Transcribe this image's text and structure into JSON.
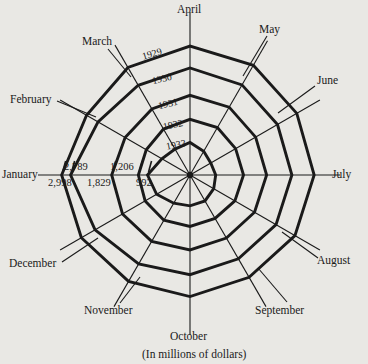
{
  "figure": {
    "caption": "(In millions of dollars)",
    "background_color": "#e9e8e4",
    "line_color": "#1a1a1a"
  },
  "chart_data": {
    "type": "line",
    "subtype": "polar-radar",
    "title": "",
    "subtitle": "",
    "xlabel": "",
    "ylabel": "",
    "caption": "(In millions of dollars)",
    "units": "millions of dollars",
    "grid": false,
    "legend_position": "inline-radial-labels",
    "angular_axis": {
      "label": "Month",
      "start_angle_deg": 90,
      "direction": "clockwise",
      "categories": [
        "January",
        "February",
        "March",
        "April",
        "May",
        "June",
        "July",
        "August",
        "September",
        "October",
        "November",
        "December"
      ]
    },
    "radial_axis": {
      "label": "Value",
      "rlim": [
        0,
        3200
      ],
      "tick_labels_on_axis": "January",
      "tick_labels": [
        "2,998",
        "2,789",
        "1,829",
        "1,206",
        "992"
      ]
    },
    "ring_labels": [
      "1929",
      "1930",
      "1931",
      "1932",
      "1933"
    ],
    "january_values": [
      2998,
      2789,
      1829,
      1206,
      992
    ],
    "series": [
      {
        "name": "1929",
        "ring_index": 0,
        "january_value": 2998,
        "values": [
          2998,
          2790,
          2900,
          3010,
          2960,
          2880,
          2900,
          2830,
          2760,
          2840,
          2870,
          2930
        ]
      },
      {
        "name": "1930",
        "ring_index": 1,
        "january_value": 2789,
        "values": [
          2789,
          2480,
          2420,
          2500,
          2430,
          2360,
          2380,
          2320,
          2260,
          2330,
          2400,
          2560
        ]
      },
      {
        "name": "1931",
        "ring_index": 2,
        "january_value": 1829,
        "values": [
          1829,
          1750,
          1780,
          1860,
          1830,
          1770,
          1790,
          1740,
          1700,
          1750,
          1790,
          1820
        ]
      },
      {
        "name": "1932",
        "ring_index": 3,
        "january_value": 1206,
        "values": [
          1206,
          1180,
          1240,
          1300,
          1280,
          1230,
          1250,
          1210,
          1170,
          1200,
          1220,
          1210
        ]
      },
      {
        "name": "1933",
        "ring_index": 4,
        "january_value": 992,
        "values": [
          992,
          760,
          700,
          760,
          640,
          560,
          600,
          640,
          700,
          720,
          760,
          900
        ]
      }
    ]
  },
  "month_labels": [
    {
      "key": "april",
      "text": "April"
    },
    {
      "key": "may",
      "text": "May"
    },
    {
      "key": "june",
      "text": "June"
    },
    {
      "key": "july",
      "text": "July"
    },
    {
      "key": "august",
      "text": "August"
    },
    {
      "key": "september",
      "text": "September"
    },
    {
      "key": "october",
      "text": "October"
    },
    {
      "key": "november",
      "text": "November"
    },
    {
      "key": "december",
      "text": "December"
    },
    {
      "key": "january",
      "text": "January"
    },
    {
      "key": "february",
      "text": "February"
    },
    {
      "key": "march",
      "text": "March"
    }
  ],
  "year_labels": [
    {
      "key": "y1929",
      "text": "1929"
    },
    {
      "key": "y1930",
      "text": "1930"
    },
    {
      "key": "y1931",
      "text": "1931"
    },
    {
      "key": "y1932",
      "text": "1932"
    },
    {
      "key": "y1933",
      "text": "1933"
    }
  ],
  "value_labels": [
    {
      "key": "v2998",
      "text": "2,998"
    },
    {
      "key": "v2789",
      "text": "2,789"
    },
    {
      "key": "v1829",
      "text": "1,829"
    },
    {
      "key": "v1206",
      "text": "1,206"
    },
    {
      "key": "v992",
      "text": "992"
    }
  ]
}
